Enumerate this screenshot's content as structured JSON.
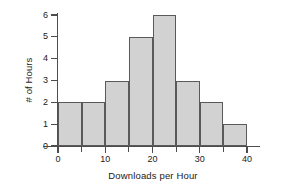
{
  "chart_data": {
    "type": "bar",
    "title": "",
    "subtitle": "",
    "xlabel": "Downloads per Hour",
    "ylabel": "# of Hours",
    "bin_width": 5,
    "bin_edges": [
      0,
      5,
      10,
      15,
      20,
      25,
      30,
      35,
      40
    ],
    "categories": [
      "0-5",
      "5-10",
      "10-15",
      "15-20",
      "20-25",
      "25-30",
      "30-35",
      "35-40"
    ],
    "values": [
      2,
      2,
      3,
      5,
      6,
      3,
      2,
      1
    ],
    "xlim": [
      0,
      40
    ],
    "ylim": [
      0,
      6
    ],
    "xticks": [
      0,
      10,
      20,
      30,
      40
    ],
    "xticks_minor": [
      5,
      15,
      25,
      35
    ],
    "xtick_labels": [
      "0",
      "10",
      "20",
      "30",
      "40"
    ],
    "yticks": [
      0,
      1,
      2,
      3,
      4,
      5,
      6
    ],
    "ytick_labels": [
      "0",
      "1",
      "2",
      "3",
      "4",
      "5",
      "6"
    ],
    "grid": false,
    "legend": false,
    "legend_position": "none",
    "annotations": [],
    "colors": {
      "bar_fill": "#d2d2d2",
      "bar_edge": "#5a5a5a",
      "axis": "#4d4d4d",
      "text": "#1a1a1a",
      "background": "#ffffff"
    }
  }
}
